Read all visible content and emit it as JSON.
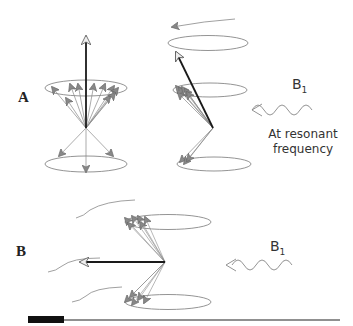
{
  "figure": {
    "panels": [
      {
        "label": "A",
        "field_label": "B",
        "field_subscript": "1",
        "caption_line1": "At resonant",
        "caption_line2": "frequency"
      },
      {
        "label": "B",
        "field_label": "B",
        "field_subscript": "1"
      }
    ],
    "colors": {
      "stroke": "#7a7a7a",
      "net_vector": "#1a1a1a",
      "scale_bar": "#111111"
    }
  }
}
